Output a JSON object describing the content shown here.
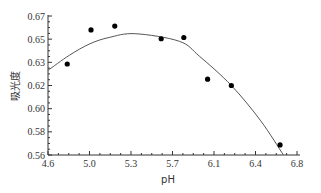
{
  "chart_data": {
    "type": "scatter",
    "title": "",
    "xlabel": "pH",
    "ylabel": "吸光度",
    "xlim": [
      4.6,
      6.8
    ],
    "ylim": [
      0.56,
      0.67
    ],
    "x_tick_labels": [
      "4.6",
      "5.0",
      "5.3",
      "5.7",
      "6.1",
      "6.4",
      "6.8"
    ],
    "y_tick_labels": [
      "0.67",
      "0.65",
      "0.63",
      "0.62",
      "0.60",
      "0.58",
      "0.56"
    ],
    "grid": false,
    "legend": null,
    "series": [
      {
        "name": "measured",
        "type": "scatter",
        "marker": "filled-circle",
        "color": "#000000",
        "x": [
          4.77,
          4.98,
          5.19,
          5.6,
          5.8,
          6.01,
          6.22,
          6.65
        ],
        "y": [
          0.632,
          0.659,
          0.662,
          0.652,
          0.653,
          0.62,
          0.615,
          0.568
        ]
      },
      {
        "name": "fit",
        "type": "line",
        "style": "quadratic-fit",
        "color": "#555555",
        "x": [
          4.6,
          4.79,
          4.97,
          5.14,
          5.37,
          5.76,
          5.94,
          6.22,
          6.48,
          6.68
        ],
        "y": [
          0.627,
          0.639,
          0.648,
          0.653,
          0.656,
          0.65,
          0.638,
          0.615,
          0.587,
          0.56
        ]
      }
    ]
  },
  "axes": {
    "x_title": "pH",
    "y_title": "吸光度"
  }
}
